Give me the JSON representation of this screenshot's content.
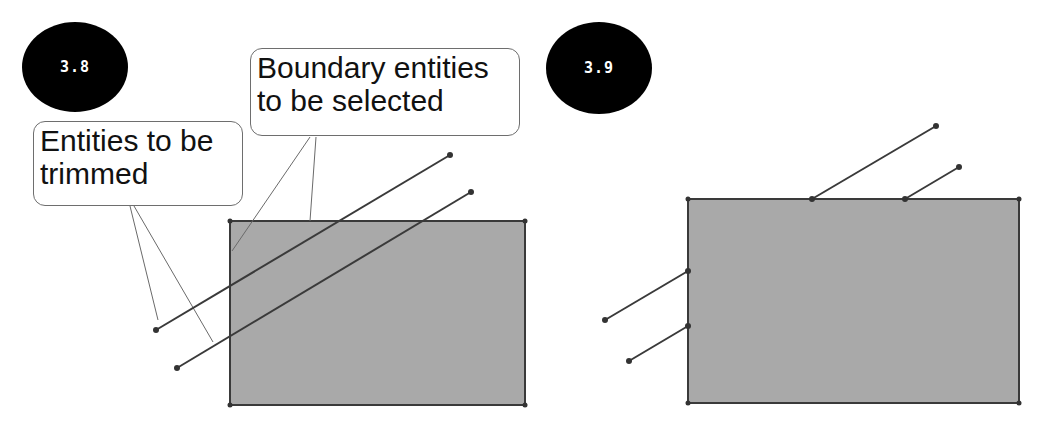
{
  "figures": [
    {
      "id": "3.8",
      "badge_label": "3.8",
      "callouts": [
        {
          "name": "entities-to-be-trimmed",
          "lines": [
            "Entities to be",
            "trimmed"
          ]
        },
        {
          "name": "boundary-entities",
          "lines": [
            "Boundary entities",
            "to be selected"
          ]
        }
      ]
    },
    {
      "id": "3.9",
      "badge_label": "3.9"
    }
  ],
  "colors": {
    "rect_fill": "#a9a9a9",
    "rect_stroke": "#3a3a3a",
    "line_stroke": "#3a3a3a",
    "leader_stroke": "#6a6a6a",
    "badge_bg": "#000000",
    "badge_text": "#ffffff"
  }
}
